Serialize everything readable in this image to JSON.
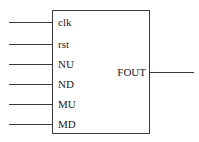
{
  "diagram": {
    "type": "block",
    "block": {
      "inputs": [
        {
          "label": "clk",
          "y": 22
        },
        {
          "label": "rst",
          "y": 44
        },
        {
          "label": "NU",
          "y": 64
        },
        {
          "label": "ND",
          "y": 84
        },
        {
          "label": "MU",
          "y": 104
        },
        {
          "label": "MD",
          "y": 124
        }
      ],
      "outputs": [
        {
          "label": "FOUT",
          "y": 72
        }
      ]
    },
    "colors": {
      "line": "#3a3a3a",
      "text": "#222222",
      "background": "#ffffff"
    }
  }
}
